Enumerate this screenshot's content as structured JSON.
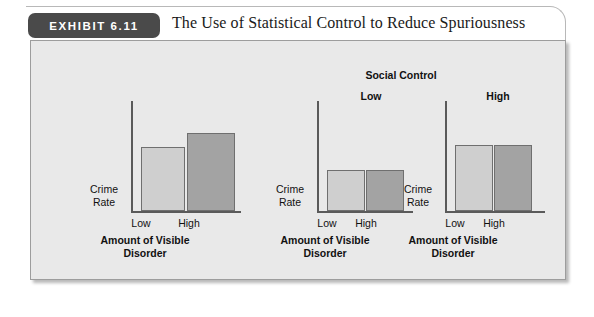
{
  "exhibit": {
    "badge": "EXHIBIT 6.11",
    "title": "The Use of Statistical Control to Reduce Spuriousness"
  },
  "group": {
    "header": "Social Control",
    "low_label": "Low",
    "high_label": "High"
  },
  "colors": {
    "bar_low": "#cfcfcf",
    "bar_high": "#a3a3a3",
    "bar_border": "#6f6f6f",
    "panel_bg": "#e9e9e9",
    "badge_bg": "#4a4a4a",
    "axis": "#5a5a5a"
  },
  "chart_data": [
    {
      "type": "bar",
      "title": "",
      "panel": "overall",
      "categories": [
        "Low",
        "High"
      ],
      "values": [
        70,
        85
      ],
      "xlabel_line1": "Amount of Visible",
      "xlabel_line2": "Disorder",
      "ylabel_line1": "Crime",
      "ylabel_line2": "Rate",
      "ylim": [
        0,
        120
      ],
      "grid": false,
      "legend": "none"
    },
    {
      "type": "bar",
      "title": "Low",
      "panel": "social-control-low",
      "categories": [
        "Low",
        "High"
      ],
      "values": [
        45,
        45
      ],
      "xlabel_line1": "Amount of Visible",
      "xlabel_line2": "Disorder",
      "ylabel_line1": "Crime",
      "ylabel_line2": "Rate",
      "ylim": [
        0,
        120
      ],
      "grid": false,
      "legend": "none"
    },
    {
      "type": "bar",
      "title": "High",
      "panel": "social-control-high",
      "categories": [
        "Low",
        "High"
      ],
      "values": [
        72,
        72
      ],
      "xlabel_line1": "Amount of Visible",
      "xlabel_line2": "Disorder",
      "ylabel_line1": "Crime",
      "ylabel_line2": "Rate",
      "ylim": [
        0,
        120
      ],
      "grid": false,
      "legend": "none"
    }
  ]
}
